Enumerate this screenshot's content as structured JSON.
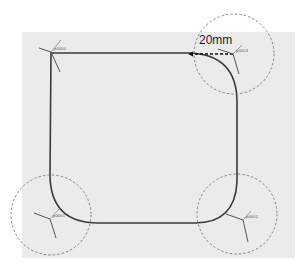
{
  "diagram": {
    "canvas_color": "#ebebeb",
    "path_color": "#333333",
    "dimension": {
      "label": "20mm",
      "line_style": "dashed"
    },
    "nodes": [
      {
        "id": "p0000",
        "label": "p0000",
        "position": "top-left",
        "highlighted": false
      },
      {
        "id": "p0003",
        "label": "p0003",
        "position": "top-right",
        "highlighted": true
      },
      {
        "id": "p0001",
        "label": "p0001",
        "position": "bottom-left",
        "highlighted": true
      },
      {
        "id": "p0002",
        "label": "p0002",
        "position": "bottom-right",
        "highlighted": true
      }
    ],
    "corner_highlight": {
      "style": "dashed-circle",
      "color": "#777777"
    }
  }
}
